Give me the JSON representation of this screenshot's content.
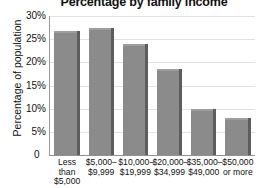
{
  "chart_data": {
    "type": "bar",
    "title": "Percentage by family income",
    "xlabel": "",
    "ylabel": "Percentage of population",
    "categories": [
      "Less than $5,000",
      "$5,000–$9,999",
      "$10,000–$19,999",
      "$20,000–$34,999",
      "$35,000–$49,000",
      "$50,000 or more"
    ],
    "category_lines": [
      [
        "Less",
        "than",
        "$5,000"
      ],
      [
        "$5,000–",
        "$9,999"
      ],
      [
        "$10,000–",
        "$19,999"
      ],
      [
        "$20,000–",
        "$34,999"
      ],
      [
        "$35,000–",
        "$49,000"
      ],
      [
        "$50,000",
        "or more"
      ]
    ],
    "values": [
      26.8,
      27.5,
      24.0,
      18.5,
      10.0,
      8.0
    ],
    "ylim": [
      0,
      30
    ],
    "yticks": [
      0,
      5,
      10,
      15,
      20,
      25,
      30
    ],
    "ytick_labels": [
      "0",
      "5%",
      "10%",
      "15%",
      "20%",
      "25%",
      "30%"
    ],
    "grid": true,
    "legend": "none",
    "bar_color": "#8b8b8b",
    "bar_shadow_color": "#5d5d5d",
    "gridline_color": "#e2e2e2",
    "axis_color": "#8f8f8f"
  }
}
